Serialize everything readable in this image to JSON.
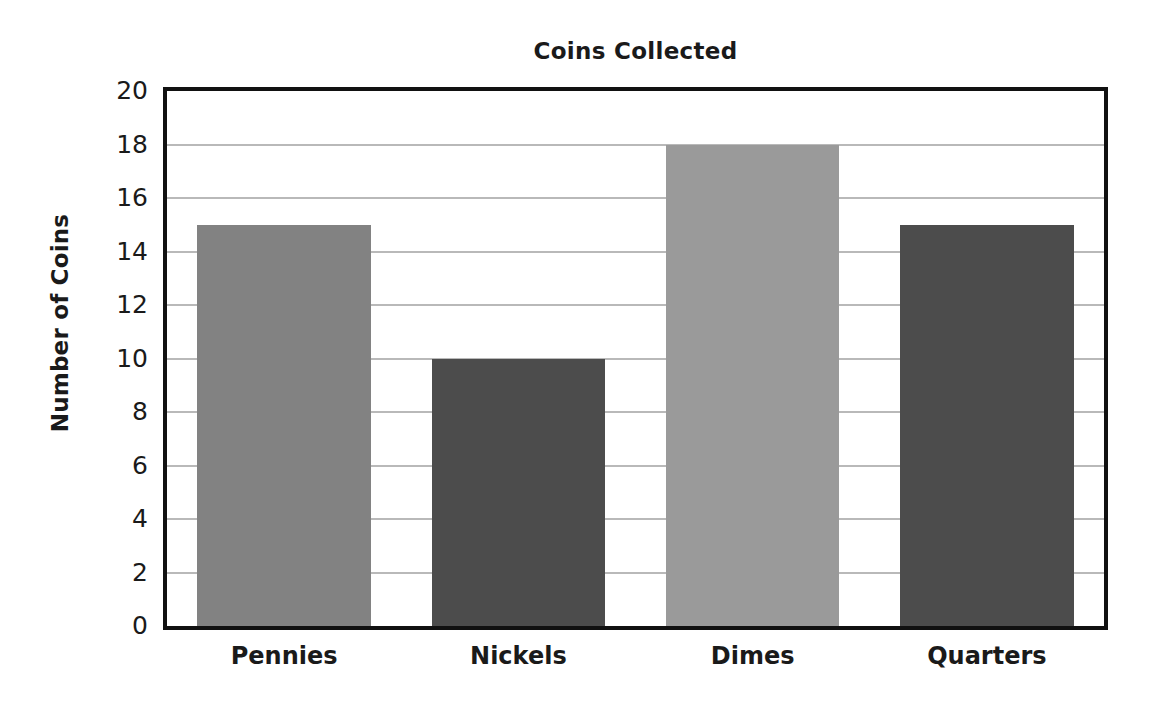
{
  "chart_data": {
    "type": "bar",
    "title": "Coins Collected",
    "xlabel": "",
    "ylabel": "Number of Coins",
    "categories": [
      "Pennies",
      "Nickels",
      "Dimes",
      "Quarters"
    ],
    "values": [
      15,
      10,
      18,
      15
    ],
    "ylim": [
      0,
      20
    ],
    "ytick_step": 2,
    "yticks": [
      20,
      18,
      16,
      14,
      12,
      10,
      8,
      6,
      4,
      2,
      0
    ],
    "grid": true,
    "legend": "none",
    "bar_colors": [
      "#828282",
      "#4c4c4c",
      "#9a9a9a",
      "#4c4c4c"
    ],
    "frame_color": "#111111",
    "gridline_color": "#b9b9b9",
    "background_color": "#ffffff",
    "text_color": "#1a1a1a"
  }
}
